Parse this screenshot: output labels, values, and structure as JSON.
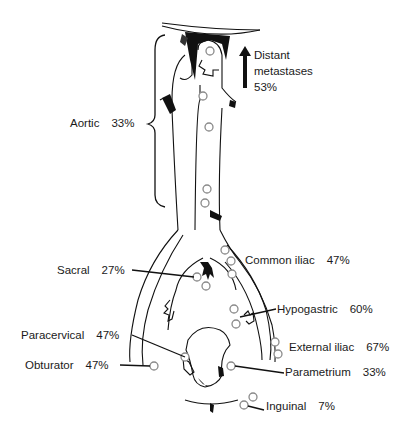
{
  "figure": {
    "labels": {
      "distant": {
        "line1": "Distant",
        "line2": "metastases",
        "pct": "53%"
      },
      "aortic": {
        "name": "Aortic",
        "pct": "33%"
      },
      "common_iliac": {
        "name": "Common iliac",
        "pct": "47%"
      },
      "sacral": {
        "name": "Sacral",
        "pct": "27%"
      },
      "hypogastric": {
        "name": "Hypogastric",
        "pct": "60%"
      },
      "paracervical": {
        "name": "Paracervical",
        "pct": "47%"
      },
      "external_iliac": {
        "name": "External iliac",
        "pct": "67%"
      },
      "obturator": {
        "name": "Obturator",
        "pct": "47%"
      },
      "parametrium": {
        "name": "Parametrium",
        "pct": "33%"
      },
      "inguinal": {
        "name": "Inguinal",
        "pct": "7%"
      }
    },
    "icons": {
      "arrow": "up-arrow-icon",
      "brace": "curly-brace-icon",
      "node": "lymph-node-circle"
    }
  }
}
